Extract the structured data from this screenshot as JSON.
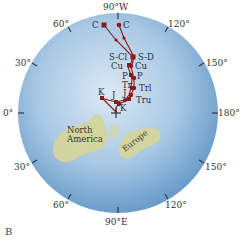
{
  "figure": {
    "panel_label": "B",
    "globe_colors": {
      "ocean_light": "#d6e6f2",
      "ocean_dark": "#6a9cc9",
      "land": "#d6d69a",
      "path": "#8b1a1a",
      "tick": "#2a3a50"
    },
    "longitude_labels": {
      "top": "90°W",
      "top_left": "60°",
      "top_right": "120°",
      "upper_left": "30°",
      "upper_right": "150°",
      "left": "0°",
      "right": "180°",
      "lower_left": "30°",
      "lower_right": "150°",
      "bottom_left": "60°",
      "bottom_right": "120°",
      "bottom": "90°E"
    },
    "landmasses": [
      {
        "name": "North America",
        "label_line1": "North",
        "label_line2": "America"
      },
      {
        "name": "Europe",
        "label": "Europe"
      }
    ],
    "pole_marker": "+",
    "path_labels": {
      "c_left": "C",
      "c_right": "C",
      "s_cl": "S-Cl",
      "s_d": "S-D",
      "cu_left": "Cu",
      "cu_right": "Cu",
      "p_left": "P",
      "p_right": "P",
      "tr": "Tr",
      "trl": "Trl",
      "j_upper": "J",
      "tru": "Tru",
      "k_left": "K",
      "j_left": "J",
      "k_bottom": "K"
    }
  }
}
